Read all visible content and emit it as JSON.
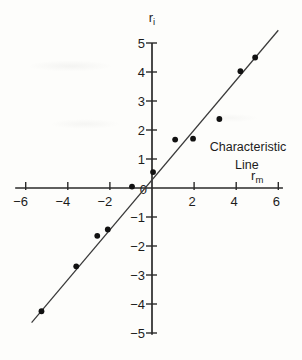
{
  "figure": {
    "background": "#fdfdfb",
    "ink": "#1c1c1c",
    "axis_color": "#2a2a2a",
    "point_color": "#111111",
    "line_color": "#3a3a3a"
  },
  "chart_data": {
    "type": "scatter",
    "title": "",
    "xlabel": "r_m",
    "ylabel": "r_i",
    "axis_labels": {
      "y": {
        "base": "r",
        "sub": "i",
        "at_x": 0,
        "at_y": 5.72
      },
      "x": {
        "base": "r",
        "sub": "m",
        "at_x": 5.0,
        "at_y": 0.26
      }
    },
    "xlim": [
      -6.5,
      6.22
    ],
    "ylim": [
      -5.06,
      5.0
    ],
    "grid": false,
    "x_ticks": [
      {
        "value": -6,
        "label": "−6"
      },
      {
        "value": -4,
        "label": "−4"
      },
      {
        "value": -2,
        "label": "−2"
      },
      {
        "value": 2,
        "label": "2"
      },
      {
        "value": 4,
        "label": "4"
      },
      {
        "value": 6,
        "label": "6"
      }
    ],
    "y_ticks": [
      {
        "value": -5,
        "label": "−5"
      },
      {
        "value": -4,
        "label": "−4"
      },
      {
        "value": -3,
        "label": "−3"
      },
      {
        "value": -2,
        "label": "−2"
      },
      {
        "value": -1,
        "label": "−1"
      },
      {
        "value": 1,
        "label": "1"
      },
      {
        "value": 2,
        "label": "2"
      },
      {
        "value": 3,
        "label": "3"
      },
      {
        "value": 4,
        "label": "4"
      },
      {
        "value": 5,
        "label": "5"
      }
    ],
    "origin_label": "0",
    "points": [
      {
        "x": -5.25,
        "y": -4.25
      },
      {
        "x": -3.6,
        "y": -2.7
      },
      {
        "x": -2.6,
        "y": -1.65
      },
      {
        "x": -2.1,
        "y": -1.43
      },
      {
        "x": -0.95,
        "y": 0.05
      },
      {
        "x": 0.05,
        "y": 0.55
      },
      {
        "x": 1.1,
        "y": 1.67
      },
      {
        "x": 1.95,
        "y": 1.7
      },
      {
        "x": 3.2,
        "y": 2.38
      },
      {
        "x": 4.2,
        "y": 4.03
      },
      {
        "x": 4.9,
        "y": 4.5
      }
    ],
    "fit_line": {
      "slope": 0.86,
      "intercept": 0.28,
      "x_start": -5.72,
      "x_end": 6.0
    },
    "annotations": [
      {
        "text": "Characteristic",
        "x": 4.56,
        "y": 1.26
      },
      {
        "text": "Line",
        "x": 4.51,
        "y": 0.64
      }
    ]
  }
}
